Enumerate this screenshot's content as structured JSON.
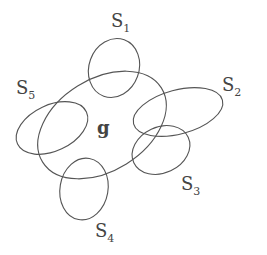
{
  "diagram": {
    "center": {
      "label": "g"
    },
    "sets": [
      {
        "id": "S1",
        "letter": "S",
        "index": "1"
      },
      {
        "id": "S2",
        "letter": "S",
        "index": "2"
      },
      {
        "id": "S3",
        "letter": "S",
        "index": "3"
      },
      {
        "id": "S4",
        "letter": "S",
        "index": "4"
      },
      {
        "id": "S5",
        "letter": "S",
        "index": "5"
      }
    ],
    "colors": {
      "stroke": "#555555",
      "text": "#444444",
      "background": "#ffffff"
    }
  }
}
